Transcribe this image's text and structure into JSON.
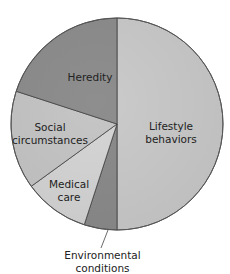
{
  "chart_data": {
    "type": "pie",
    "title": "",
    "start_angle_deg": 0,
    "direction": "clockwise",
    "slices": [
      {
        "label": "Lifestyle behaviors",
        "value": 50,
        "color": "#cbcbcb"
      },
      {
        "label": "Environmental conditions",
        "value": 5,
        "color": "#8c8c8c"
      },
      {
        "label": "Medical care",
        "value": 10,
        "color": "#d6d6d6"
      },
      {
        "label": "Social circumstances",
        "value": 15,
        "color": "#c6c6c6"
      },
      {
        "label": "Heredity",
        "value": 20,
        "color": "#8e8e8e"
      }
    ]
  },
  "labels": {
    "lifestyle_1": "Lifestyle",
    "lifestyle_2": "behaviors",
    "heredity": "Heredity",
    "social_1": "Social",
    "social_2": "circumstances",
    "medical_1": "Medical",
    "medical_2": "care",
    "env_1": "Environmental",
    "env_2": "conditions"
  }
}
